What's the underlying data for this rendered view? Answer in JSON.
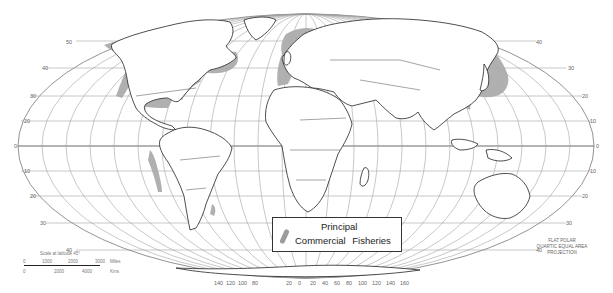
{
  "map": {
    "title": "Principal Commercial Fisheries",
    "projection": "Flat Polar Quartic Equal Area Projection",
    "legend": {
      "line1": "Principal",
      "line2": "Commercial Fisheries",
      "swatch_color": "#9c9c9c",
      "swatch_meaning": "fishery-area"
    },
    "latitude_labels_left": [
      "50",
      "40",
      "30",
      "20",
      "10",
      "0",
      "10",
      "20",
      "30",
      "40"
    ],
    "latitude_labels_right": [
      "40",
      "30",
      "20",
      "10",
      "0",
      "10",
      "20",
      "30",
      "40"
    ],
    "longitude_labels_bottom": [
      "140",
      "120",
      "100",
      "80",
      "20",
      "0",
      "20",
      "40",
      "60",
      "80",
      "100",
      "120",
      "140",
      "160"
    ],
    "scale": {
      "title": "Scale at latitude 45°",
      "miles_ticks": [
        "0",
        "1000",
        "2000",
        "3000"
      ],
      "miles_unit": "Miles",
      "km_ticks": [
        "0",
        "2000",
        "4000"
      ],
      "km_unit": "Kms"
    },
    "projection_note": [
      "FLAT POLAR",
      "QUARTIC EQUAL AREA",
      "PROJECTION"
    ],
    "fishery_regions": [
      "Northeast Pacific / Alaska coast",
      "Northwest Atlantic / Grand Banks",
      "US Atlantic & Gulf coast",
      "Northeast Atlantic / North Sea",
      "Northwest Pacific / Japan & East Asia",
      "Peru–Chile coast",
      "Southwest Atlantic (Patagonian shelf)"
    ],
    "colors": {
      "fishery_fill": "#a9a9a9",
      "land_fill": "#ffffff",
      "coastline": "#222222",
      "graticule": "#9a9a9a"
    }
  }
}
